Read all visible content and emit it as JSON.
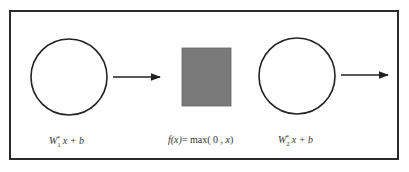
{
  "diagram": {
    "type": "neural-network-layer-flow",
    "frame_color": "#2a2a2a",
    "nodes": [
      {
        "id": "linear-1",
        "shape": "circle",
        "label": {
          "var": "W",
          "sub": "1",
          "sup": "*",
          "rest": " x + b"
        }
      },
      {
        "id": "relu",
        "shape": "rectangle",
        "fill": "#7a7a7a",
        "label": {
          "fn": "f",
          "arg": "(x)",
          "eq": "= max( 0 , ",
          "x": "x",
          "close": ")"
        }
      },
      {
        "id": "linear-2",
        "shape": "circle",
        "label": {
          "var": "W",
          "sub": "2",
          "sup": "*",
          "rest": " x + b"
        }
      }
    ],
    "edges": [
      {
        "from": "linear-1",
        "to": "relu"
      },
      {
        "from": "linear-2",
        "to": "output"
      }
    ]
  }
}
